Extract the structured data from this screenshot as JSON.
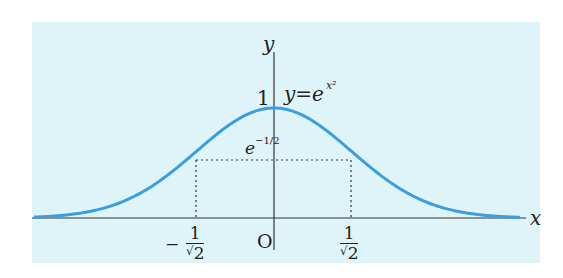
{
  "diagram": {
    "type": "function_graph",
    "function_label": {
      "prefix": "y=e",
      "exponent": "x²"
    },
    "axes": {
      "x_label": "x",
      "y_label": "y",
      "origin_label": "O"
    },
    "y_tick": "1",
    "level_label": {
      "base": "e",
      "exponent": "−1/2"
    },
    "x_ticks": {
      "left": {
        "sign": "−",
        "numerator": "1",
        "denominator": "2",
        "radical": "√"
      },
      "right": {
        "numerator": "1",
        "denominator": "2",
        "radical": "√"
      }
    },
    "colors": {
      "background": "#dff4f9",
      "curve": "#3a9ee0",
      "axes": "#333333"
    }
  },
  "chart_data": {
    "type": "line",
    "xlabel": "x",
    "ylabel": "y",
    "series": [
      {
        "name": "curve",
        "points": [
          [
            -3,
            0.0001
          ],
          [
            -2,
            0.018
          ],
          [
            -1.5,
            0.105
          ],
          [
            -1,
            0.368
          ],
          [
            -0.7071,
            0.607
          ],
          [
            -0.5,
            0.779
          ],
          [
            0,
            1
          ],
          [
            0.5,
            0.779
          ],
          [
            0.7071,
            0.607
          ],
          [
            1,
            0.368
          ],
          [
            1.5,
            0.105
          ],
          [
            2,
            0.018
          ],
          [
            3,
            0.0001
          ]
        ]
      }
    ],
    "annotations": [
      "1",
      "e^(-1/2)",
      "-1/√2",
      "1/√2",
      "O"
    ],
    "grid": false
  }
}
